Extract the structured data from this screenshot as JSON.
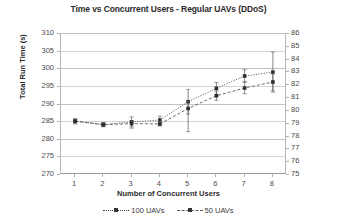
{
  "chart_data": {
    "type": "line",
    "title": "Time vs Concurrent Users - Regular UAVs (DDoS)",
    "xlabel": "Number of Concurrent Users",
    "ylabel": "Total Run Time (s)",
    "ylabel_secondary": "",
    "x": [
      1,
      2,
      3,
      4,
      5,
      6,
      7,
      8
    ],
    "xtick_labels": [
      "1",
      "2",
      "3",
      "4",
      "5",
      "6",
      "7",
      "8"
    ],
    "ylim": [
      270,
      310
    ],
    "yticks": [
      270,
      275,
      280,
      285,
      290,
      295,
      300,
      305,
      310
    ],
    "ytick_labels": [
      "270",
      "275",
      "280",
      "285",
      "290",
      "295",
      "300",
      "305",
      "310"
    ],
    "ylim_secondary": [
      75,
      86
    ],
    "yticks_secondary": [
      75,
      76,
      77,
      78,
      79,
      80,
      81,
      82,
      83,
      84,
      85,
      86
    ],
    "ytick_labels_secondary": [
      "75",
      "76",
      "77",
      "78",
      "79",
      "80",
      "81",
      "82",
      "83",
      "84",
      "85",
      "86"
    ],
    "grid": true,
    "legend_position": "bottom",
    "series": [
      {
        "name": "100 UAVs",
        "axis": "left",
        "line_style": "dotted",
        "marker": "square",
        "color": "#3a3a3a",
        "values": [
          285.0,
          284.0,
          284.8,
          285.3,
          290.5,
          294.3,
          297.8,
          298.9
        ],
        "error_low": [
          284.2,
          283.4,
          283.0,
          284.0,
          287.0,
          292.6,
          296.0,
          293.2
        ],
        "error_high": [
          285.7,
          284.6,
          286.2,
          286.4,
          294.0,
          296.0,
          299.6,
          304.6
        ]
      },
      {
        "name": "50 UAVs",
        "axis": "left",
        "line_style": "dashed",
        "marker": "square",
        "color": "#5a5a5a",
        "values": [
          285.0,
          284.0,
          284.3,
          284.2,
          288.6,
          292.2,
          294.4,
          296.1
        ],
        "error_low": [
          284.4,
          283.5,
          283.4,
          283.6,
          282.0,
          290.9,
          292.8,
          293.6
        ],
        "error_high": [
          285.6,
          284.5,
          285.0,
          285.0,
          290.5,
          293.5,
          296.2,
          298.4
        ]
      }
    ]
  },
  "legend": {
    "entries": [
      {
        "label": "100 UAVs"
      },
      {
        "label": "50 UAVs"
      }
    ]
  }
}
